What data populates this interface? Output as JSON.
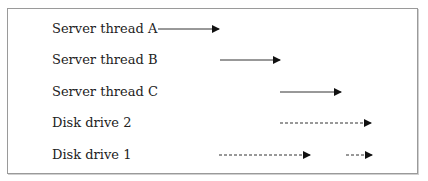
{
  "diagram": {
    "rows": [
      {
        "label": "Server thread A",
        "y": 29,
        "segments": [
          {
            "x1": 158,
            "x2": 219,
            "style": "solid"
          }
        ]
      },
      {
        "label": "Server thread B",
        "y": 60,
        "segments": [
          {
            "x1": 220,
            "x2": 280,
            "style": "solid"
          }
        ]
      },
      {
        "label": "Server thread C",
        "y": 92,
        "segments": [
          {
            "x1": 280,
            "x2": 341,
            "style": "solid"
          }
        ]
      },
      {
        "label": "Disk drive 2",
        "y": 123,
        "segments": [
          {
            "x1": 280,
            "x2": 371,
            "style": "dashed"
          }
        ]
      },
      {
        "label": "Disk drive 1",
        "y": 155,
        "segments": [
          {
            "x1": 219,
            "x2": 310,
            "style": "dashed"
          },
          {
            "x1": 346,
            "x2": 372,
            "style": "dashed"
          }
        ]
      }
    ],
    "colors": {
      "line": "#333333",
      "border": "#9a9a9a",
      "text": "#222222"
    }
  }
}
